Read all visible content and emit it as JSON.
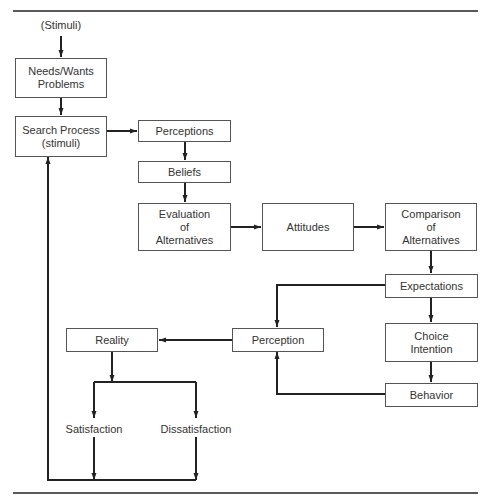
{
  "diagram": {
    "colors": {
      "line": "#222222",
      "box_border": "#555555",
      "text": "#333333"
    },
    "input_label": "(Stimuli)",
    "nodes": {
      "needs": "Needs/Wants\nProblems",
      "search": "Search Process\n(stimuli)",
      "perceptions": "Perceptions",
      "beliefs": "Beliefs",
      "evaluation": "Evaluation\nof\nAlternatives",
      "attitudes": "Attitudes",
      "comparison": "Comparison\nof\nAlternatives",
      "expectations": "Expectations",
      "choice_intention": "Choice\nIntention",
      "behavior": "Behavior",
      "perception": "Perception",
      "reality": "Reality"
    },
    "outcomes": {
      "satisfaction": "Satisfaction",
      "dissatisfaction": "Dissatisfaction"
    }
  }
}
